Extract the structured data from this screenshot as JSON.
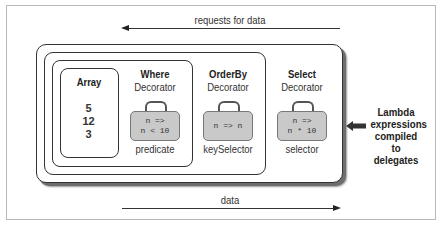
{
  "diagram": {
    "top_arrow": {
      "label": "requests for data",
      "direction": "left"
    },
    "bottom_arrow": {
      "label": "data",
      "direction": "right"
    },
    "array": {
      "title": "Array",
      "values": [
        "5",
        "12",
        "3"
      ]
    },
    "decorators": [
      {
        "name": "Where",
        "subtitle": "Decorator",
        "code_line1": "n =>",
        "code_line2": "n < 10",
        "param": "predicate"
      },
      {
        "name": "OrderBy",
        "subtitle": "Decorator",
        "code_line1": "n => n",
        "code_line2": "",
        "param": "keySelector"
      },
      {
        "name": "Select",
        "subtitle": "Decorator",
        "code_line1": "n =>",
        "code_line2": "n * 10",
        "param": "selector"
      }
    ],
    "side_note": {
      "line1": "Lambda",
      "line2": "expressions",
      "line3": "compiled to",
      "line4": "delegates"
    },
    "colors": {
      "bag_fill": "#c9c9c9",
      "border": "#333333",
      "shadow": "#6d6d6d",
      "frame": "#b9b9b9"
    }
  }
}
